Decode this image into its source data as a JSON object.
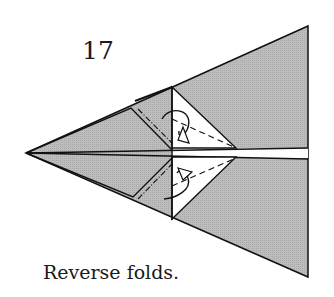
{
  "diagram": {
    "step_number": "17",
    "caption": "Reverse folds.",
    "colors": {
      "paper": "#b8b8b8",
      "white": "#ffffff",
      "line": "#111111"
    }
  }
}
